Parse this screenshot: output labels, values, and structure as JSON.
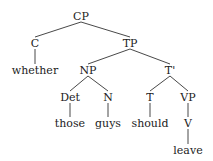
{
  "diagram": {
    "type": "syntax-tree",
    "nodes": [
      {
        "id": "CP",
        "label": "CP",
        "x": 81,
        "y": 16
      },
      {
        "id": "C",
        "label": "C",
        "x": 35,
        "y": 43
      },
      {
        "id": "TP",
        "label": "TP",
        "x": 130,
        "y": 43
      },
      {
        "id": "whether",
        "label": "whether",
        "x": 35,
        "y": 70
      },
      {
        "id": "NP",
        "label": "NP",
        "x": 88,
        "y": 70
      },
      {
        "id": "Tbar",
        "label": "T'",
        "x": 170,
        "y": 70
      },
      {
        "id": "Det",
        "label": "Det",
        "x": 70,
        "y": 97
      },
      {
        "id": "N",
        "label": "N",
        "x": 108,
        "y": 97
      },
      {
        "id": "T",
        "label": "T",
        "x": 150,
        "y": 97
      },
      {
        "id": "VP",
        "label": "VP",
        "x": 188,
        "y": 97
      },
      {
        "id": "those",
        "label": "those",
        "x": 70,
        "y": 123
      },
      {
        "id": "guys",
        "label": "guys",
        "x": 108,
        "y": 123
      },
      {
        "id": "should",
        "label": "should",
        "x": 150,
        "y": 123
      },
      {
        "id": "V",
        "label": "V",
        "x": 188,
        "y": 123
      },
      {
        "id": "leave",
        "label": "leave",
        "x": 188,
        "y": 150
      }
    ],
    "edges": [
      [
        "CP",
        "C"
      ],
      [
        "CP",
        "TP"
      ],
      [
        "C",
        "whether"
      ],
      [
        "TP",
        "NP"
      ],
      [
        "TP",
        "Tbar"
      ],
      [
        "NP",
        "Det"
      ],
      [
        "NP",
        "N"
      ],
      [
        "Tbar",
        "T"
      ],
      [
        "Tbar",
        "VP"
      ],
      [
        "Det",
        "those"
      ],
      [
        "N",
        "guys"
      ],
      [
        "T",
        "should"
      ],
      [
        "VP",
        "V"
      ],
      [
        "V",
        "leave"
      ]
    ]
  }
}
